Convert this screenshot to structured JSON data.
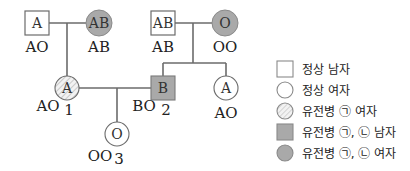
{
  "colors": {
    "line": "#6b6b6b",
    "affected_fill": "#a9a9a9",
    "normal_fill": "#ffffff",
    "hatch": "#b8b8b8"
  },
  "pedigree": {
    "gen1_left_male": {
      "symbol": "A",
      "genotype": "AO",
      "status": "normal-male"
    },
    "gen1_left_female": {
      "symbol": "AB",
      "genotype": "AB",
      "status": "disease-a-b-female"
    },
    "gen1_right_male": {
      "symbol": "AB",
      "genotype": "AB",
      "status": "normal-male"
    },
    "gen1_right_female": {
      "symbol": "O",
      "genotype": "OO",
      "status": "disease-a-b-female"
    },
    "person1": {
      "symbol": "A",
      "genotype": "AO",
      "number": "1",
      "status": "disease-a-female"
    },
    "person2": {
      "symbol": "B",
      "genotype": "BO",
      "number": "2",
      "status": "disease-a-b-male"
    },
    "sibling2": {
      "symbol": "A",
      "genotype": "AO",
      "status": "normal-female"
    },
    "person3": {
      "symbol": "O",
      "genotype": "OO",
      "number": "3",
      "status": "normal-female"
    }
  },
  "legend": {
    "items": [
      {
        "icon": "normal-male-square-icon",
        "label": "정상 남자"
      },
      {
        "icon": "normal-female-circle-icon",
        "label": "정상 여자"
      },
      {
        "icon": "disease-a-female-hatched-circle-icon",
        "label": "유전병 ㉠ 여자"
      },
      {
        "icon": "disease-a-b-male-shaded-square-icon",
        "label": "유전병 ㉠, ㉡ 남자"
      },
      {
        "icon": "disease-a-b-female-shaded-circle-icon",
        "label": "유전병 ㉠, ㉡ 여자"
      }
    ]
  }
}
